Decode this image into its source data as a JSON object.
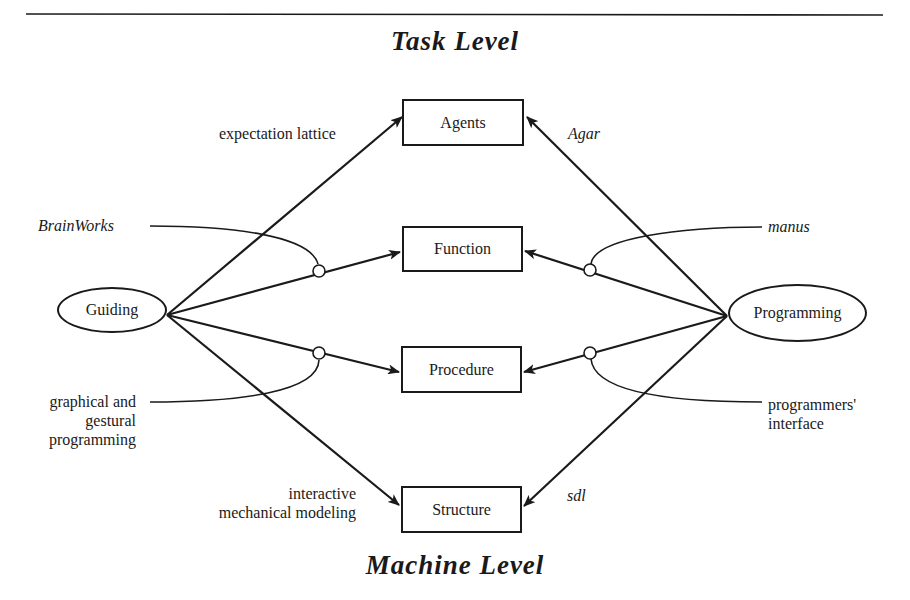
{
  "diagram": {
    "top_level": "Task Level",
    "bottom_level": "Machine Level",
    "sources": [
      {
        "id": "guiding",
        "label": "Guiding"
      },
      {
        "id": "programming",
        "label": "Programming"
      }
    ],
    "targets": [
      {
        "id": "agents",
        "label": "Agents"
      },
      {
        "id": "function",
        "label": "Function"
      },
      {
        "id": "procedure",
        "label": "Procedure"
      },
      {
        "id": "structure",
        "label": "Structure"
      }
    ],
    "annotations": {
      "expectation_lattice": "expectation lattice",
      "agar": "Agar",
      "brainworks": "BrainWorks",
      "manus": "manus",
      "graphical_1": "graphical and",
      "graphical_2": "gestural",
      "graphical_3": "programming",
      "programmers_1": "programmers'",
      "programmers_2": "interface",
      "interactive_1": "interactive",
      "interactive_2": "mechanical modeling",
      "sdl": "sdl"
    },
    "edges": [
      {
        "from": "Guiding",
        "to": "Agents",
        "label": "expectation lattice"
      },
      {
        "from": "Guiding",
        "to": "Function",
        "label": "BrainWorks"
      },
      {
        "from": "Guiding",
        "to": "Procedure",
        "label": "graphical and gestural programming"
      },
      {
        "from": "Guiding",
        "to": "Structure",
        "label": "interactive mechanical modeling"
      },
      {
        "from": "Programming",
        "to": "Agents",
        "label": "Agar"
      },
      {
        "from": "Programming",
        "to": "Function",
        "label": "manus"
      },
      {
        "from": "Programming",
        "to": "Procedure",
        "label": "programmers' interface"
      },
      {
        "from": "Programming",
        "to": "Structure",
        "label": "sdl"
      }
    ]
  }
}
